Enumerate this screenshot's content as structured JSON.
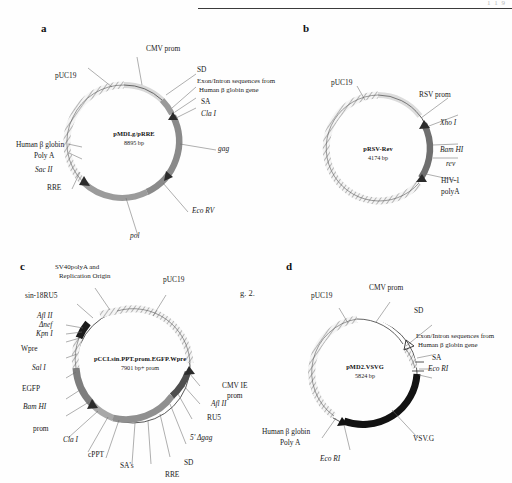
{
  "page": {
    "header_rule": true,
    "corner_text": "1 1 9",
    "figure_caption_fragment": "g. 2."
  },
  "colors": {
    "backbone_outline": "#4a4a4a",
    "hatch_fill": "#f2f2f2",
    "gene_gray": "#8a8a8a",
    "gene_dark": "#3a3a3a",
    "gene_black": "#141414",
    "leader_line": "#6d6d6d",
    "text": "#1a1a1a"
  },
  "panels": [
    {
      "letter": "a",
      "plasmid_name": "pMDLg/pRRE",
      "plasmid_size": "8895 bp",
      "labels": [
        {
          "id": "cmv-prom",
          "text": "CMV prom"
        },
        {
          "id": "sd",
          "text": "SD"
        },
        {
          "id": "exon-intron",
          "text": "Exon/Intron sequences from"
        },
        {
          "id": "exon-intron-2",
          "text": "Human β globin gene"
        },
        {
          "id": "sa",
          "text": "SA"
        },
        {
          "id": "cla-i",
          "text": "Cla I",
          "italic_prefix": "Cla"
        },
        {
          "id": "puc19",
          "text": "pUC19"
        },
        {
          "id": "gag",
          "text": "gag",
          "style": "italic"
        },
        {
          "id": "eco-rv",
          "text": "Eco RV",
          "style": "italic"
        },
        {
          "id": "pol",
          "text": "pol",
          "style": "italic"
        },
        {
          "id": "rre",
          "text": "RRE"
        },
        {
          "id": "sac-ii",
          "text": "Sac II"
        },
        {
          "id": "human-b-globin",
          "text": "Human β globin"
        },
        {
          "id": "poly-a",
          "text": "Poly A"
        }
      ]
    },
    {
      "letter": "b",
      "plasmid_name": "pRSV-Rev",
      "plasmid_size": "4174 bp",
      "labels": [
        {
          "id": "puc19",
          "text": "pUC19"
        },
        {
          "id": "rsv-prom",
          "text": "RSV prom"
        },
        {
          "id": "xho-i",
          "text": "Xho I"
        },
        {
          "id": "bam-hi",
          "text": "Bam HI"
        },
        {
          "id": "rev",
          "text": "rev"
        },
        {
          "id": "hiv1",
          "text": "HIV-1"
        },
        {
          "id": "polya",
          "text": "polyA"
        }
      ]
    },
    {
      "letter": "c",
      "plasmid_name": "pCCLsin.PPT.prom.EGFP.Wpre",
      "plasmid_size": "7901 bp+ prom",
      "labels": [
        {
          "id": "sv40",
          "text": "SV40polyA and"
        },
        {
          "id": "sv40-2",
          "text": "Replication Origin"
        },
        {
          "id": "puc19",
          "text": "pUC19"
        },
        {
          "id": "sin18ru5",
          "text": "sin-18RU5"
        },
        {
          "id": "afl-ii-left",
          "text": "Afl II"
        },
        {
          "id": "dnef",
          "text": "Δnef"
        },
        {
          "id": "kpn-i",
          "text": "Kpn I"
        },
        {
          "id": "wpre",
          "text": "Wpre"
        },
        {
          "id": "sal-i",
          "text": "Sal I"
        },
        {
          "id": "egfp",
          "text": "EGFP"
        },
        {
          "id": "bam-hi",
          "text": "Bam HI"
        },
        {
          "id": "prom",
          "text": "prom"
        },
        {
          "id": "cla-i",
          "text": "Cla I"
        },
        {
          "id": "cppt",
          "text": "cPPT"
        },
        {
          "id": "sas",
          "text": "SA's"
        },
        {
          "id": "rre",
          "text": "RRE"
        },
        {
          "id": "sd",
          "text": "SD"
        },
        {
          "id": "dgag",
          "text": "5' Δgag"
        },
        {
          "id": "ru5",
          "text": "RU5"
        },
        {
          "id": "afl-ii-right",
          "text": "Afl II"
        },
        {
          "id": "cmv-ie",
          "text": "CMV IE"
        },
        {
          "id": "cmv-ie-2",
          "text": "prom"
        }
      ]
    },
    {
      "letter": "d",
      "plasmid_name": "pMD2.VSVG",
      "plasmid_size": "5824 bp",
      "labels": [
        {
          "id": "puc19",
          "text": "pUC19"
        },
        {
          "id": "cmv-prom",
          "text": "CMV prom"
        },
        {
          "id": "sd",
          "text": "SD"
        },
        {
          "id": "exon-intron",
          "text": "Exon/Intron sequences from"
        },
        {
          "id": "exon-intron-2",
          "text": "Human β globin gene"
        },
        {
          "id": "sa",
          "text": "SA"
        },
        {
          "id": "eco-ri-right",
          "text": "Eco RI"
        },
        {
          "id": "vsvg",
          "text": "VSV.G"
        },
        {
          "id": "eco-ri-bottom",
          "text": "Eco RI"
        },
        {
          "id": "human-b-globin",
          "text": "Human β globin"
        },
        {
          "id": "poly-a",
          "text": "Poly A"
        }
      ]
    }
  ]
}
